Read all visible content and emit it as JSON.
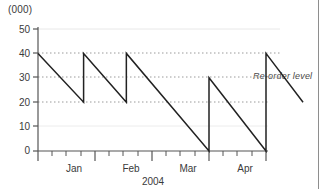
{
  "chart_data": {
    "type": "line",
    "title": "",
    "subtitle": "",
    "units_label": "(000)",
    "xlabel": "2004",
    "ylabel": "",
    "ylim": [
      0,
      50
    ],
    "y_ticks": [
      0,
      10,
      20,
      30,
      40,
      50
    ],
    "y_tick_labels": [
      "0",
      "10",
      "20",
      "30",
      "40",
      "50"
    ],
    "x_tick_labels": [
      "Jan",
      "Feb",
      "Mar",
      "Apr"
    ],
    "x_minor_ticks_per_month": 4,
    "grid": "horizontal dotted at 20, 30, 40; faint solid at 10 and 50",
    "legend": "none",
    "annotations": [
      {
        "text": "Re-order level",
        "y_value": 30,
        "style": "italic"
      }
    ],
    "series": [
      {
        "name": "Inventory level",
        "description": "Sawtooth stock depletion and replenishment pattern",
        "points": [
          {
            "x_month": 0.0,
            "y": 40
          },
          {
            "x_month": 0.8,
            "y": 20
          },
          {
            "x_month": 0.8,
            "y": 40
          },
          {
            "x_month": 1.55,
            "y": 20
          },
          {
            "x_month": 1.55,
            "y": 40
          },
          {
            "x_month": 3.0,
            "y": 0
          },
          {
            "x_month": 3.0,
            "y": 30
          },
          {
            "x_month": 4.0,
            "y": 0
          },
          {
            "x_month": 4.0,
            "y": 40
          },
          {
            "x_month": 4.65,
            "y": 20
          }
        ]
      }
    ]
  },
  "colors": {
    "series_line": "#222222",
    "axis": "#555555",
    "grid_dotted": "#9a9a9a",
    "grid_faint": "#e2e2e2",
    "text": "#3a3a3a",
    "border": "#8e8e8e",
    "background": "#ffffff"
  }
}
